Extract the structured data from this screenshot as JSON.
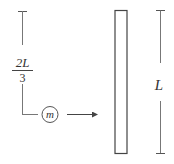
{
  "diagram": {
    "left_dimension": {
      "numerator": "2L",
      "denominator": "3"
    },
    "mass_label": "m",
    "rod_dimension_label": "L",
    "colors": {
      "stroke": "#555555",
      "text": "#333333",
      "background": "#ffffff"
    }
  }
}
